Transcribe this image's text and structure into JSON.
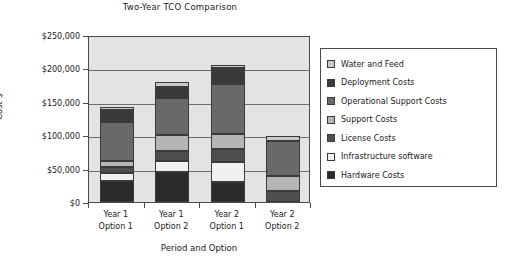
{
  "chart_data": {
    "type": "bar",
    "subtype": "stacked-vertical",
    "title": "Two-Year TCO Comparison",
    "xlabel": "Period and Option",
    "ylabel": "Cost $",
    "categories": [
      "Year 1\nOption 1",
      "Year 1\nOption 2",
      "Year 2\nOption 1",
      "Year 2\nOption 2"
    ],
    "category_lines": [
      [
        "Year 1",
        "Option 1"
      ],
      [
        "Year 1",
        "Option 2"
      ],
      [
        "Year 2",
        "Option 1"
      ],
      [
        "Year 2",
        "Option 2"
      ]
    ],
    "ylim": [
      0,
      250000
    ],
    "ytick_values": [
      0,
      50000,
      100000,
      150000,
      200000,
      250000
    ],
    "ytick_labels": [
      "$0",
      "$50,000",
      "$100,000",
      "$150,000",
      "$200,000",
      "$250,000"
    ],
    "grid": true,
    "grid_axis": "y",
    "legend_position": "right",
    "stack_order_bottom_to_top": [
      "Hardware Costs",
      "Infrastructure software",
      "License Costs",
      "Support Costs",
      "Operational Support Costs",
      "Deployment Costs",
      "Water and Feed"
    ],
    "series": [
      {
        "name": "Hardware Costs",
        "color": "#2b2b2b",
        "values": [
          32000,
          45000,
          30000,
          0
        ]
      },
      {
        "name": "Infrastructure software",
        "color": "#f0f0f0",
        "values": [
          12000,
          17000,
          30000,
          0
        ]
      },
      {
        "name": "License Costs",
        "color": "#4f4f4f",
        "values": [
          8000,
          14000,
          19000,
          17000
        ]
      },
      {
        "name": "Support Costs",
        "color": "#b5b5b5",
        "values": [
          10000,
          25000,
          23000,
          22000
        ]
      },
      {
        "name": "Operational Support Costs",
        "color": "#696969",
        "values": [
          58000,
          55000,
          74000,
          52000
        ]
      },
      {
        "name": "Deployment Costs",
        "color": "#3a3a3a",
        "values": [
          18000,
          16000,
          24000,
          0
        ]
      },
      {
        "name": "Water and Feed",
        "color": "#c9c9c9",
        "values": [
          4000,
          8000,
          5000,
          8000
        ]
      }
    ],
    "totals": [
      142000,
      180000,
      205000,
      99000
    ],
    "plot_background": "#e3e3e3"
  },
  "legend": {
    "items": [
      {
        "label": "Water and Feed",
        "color": "#c9c9c9"
      },
      {
        "label": "Deployment Costs",
        "color": "#3a3a3a"
      },
      {
        "label": "Operational Support Costs",
        "color": "#696969"
      },
      {
        "label": "Support Costs",
        "color": "#b5b5b5"
      },
      {
        "label": "License Costs",
        "color": "#4f4f4f"
      },
      {
        "label": "Infrastructure software",
        "color": "#f0f0f0"
      },
      {
        "label": "Hardware Costs",
        "color": "#2b2b2b"
      }
    ]
  }
}
